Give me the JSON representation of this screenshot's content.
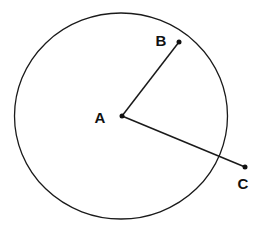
{
  "diagram": {
    "type": "geometry",
    "colors": {
      "stroke": "#1a1a1a",
      "background": "#ffffff"
    },
    "circle": {
      "cx": 121,
      "cy": 116,
      "rx": 106.5,
      "ry": 103
    },
    "points": [
      {
        "id": "A",
        "label": "A",
        "x": 122,
        "y": 116,
        "label_x": 100,
        "label_y": 123
      },
      {
        "id": "B",
        "label": "B",
        "x": 179,
        "y": 42,
        "label_x": 161,
        "label_y": 46
      },
      {
        "id": "C",
        "label": "C",
        "x": 245,
        "y": 167,
        "label_x": 243,
        "label_y": 189
      }
    ],
    "segments": [
      {
        "from": "A",
        "to": "B"
      },
      {
        "from": "A",
        "to": "C"
      }
    ]
  }
}
